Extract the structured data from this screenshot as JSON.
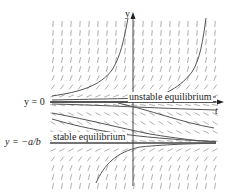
{
  "figure": {
    "type": "direction_field",
    "axes": {
      "x_label": "t",
      "y_label": "y"
    },
    "equilibria": [
      {
        "label": "y = 0",
        "annotation": "unstable equilibrium",
        "kind": "unstable"
      },
      {
        "label": "y = −a/b",
        "annotation": "stable equilibrium",
        "kind": "stable"
      }
    ],
    "colors": {
      "slope_marks": "#9a9a9a",
      "curves": "#555555",
      "axes": "#333333",
      "equilibrium_lines": "#444444"
    }
  }
}
